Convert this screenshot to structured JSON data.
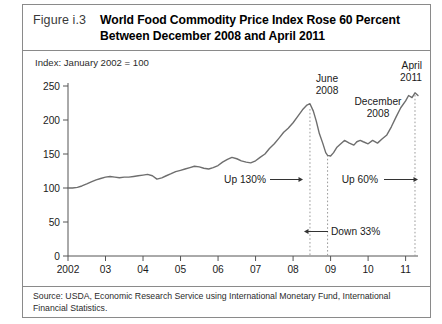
{
  "figure": {
    "label": "Figure i.3",
    "title_line1": "World Food Commodity Price Index Rose 60 Percent",
    "title_line2": "Between December 2008 and April 2011",
    "index_note": "Index: January 2002 = 100",
    "source": "Source: USDA, Economic Research Service using International Monetary Fund, International Financial Statistics."
  },
  "chart_data": {
    "type": "line",
    "title": "World Food Commodity Price Index Rose 60 Percent Between December 2008 and April 2011",
    "subtitle": "Index: January 2002 = 100",
    "xlabel": "",
    "ylabel": "Index: January 2002 = 100",
    "ylim": [
      0,
      250
    ],
    "yticks": [
      0,
      50,
      100,
      150,
      200,
      250
    ],
    "ytick_labels": [
      "0",
      "50",
      "100",
      "150",
      "200",
      "250"
    ],
    "xlim": [
      2002.0,
      2011.33
    ],
    "xticks": [
      2002,
      2003,
      2004,
      2005,
      2006,
      2007,
      2008,
      2009,
      2010,
      2011
    ],
    "xtick_labels": [
      "2002",
      "03",
      "04",
      "05",
      "06",
      "07",
      "08",
      "09",
      "10",
      "11"
    ],
    "grid": false,
    "legend": null,
    "line_color": "#6e6e6e",
    "series": [
      {
        "name": "World Food Commodity Price Index",
        "x": [
          2002.0,
          2002.12,
          2002.25,
          2002.37,
          2002.5,
          2002.62,
          2002.75,
          2002.87,
          2003.0,
          2003.12,
          2003.25,
          2003.37,
          2003.5,
          2003.62,
          2003.75,
          2003.87,
          2004.0,
          2004.12,
          2004.25,
          2004.37,
          2004.5,
          2004.62,
          2004.75,
          2004.87,
          2005.0,
          2005.12,
          2005.25,
          2005.37,
          2005.5,
          2005.62,
          2005.75,
          2005.87,
          2006.0,
          2006.12,
          2006.25,
          2006.37,
          2006.5,
          2006.62,
          2006.75,
          2006.87,
          2007.0,
          2007.12,
          2007.25,
          2007.37,
          2007.5,
          2007.62,
          2007.75,
          2007.87,
          2008.0,
          2008.12,
          2008.25,
          2008.37,
          2008.45,
          2008.54,
          2008.62,
          2008.7,
          2008.79,
          2008.87,
          2008.92,
          2009.0,
          2009.08,
          2009.17,
          2009.25,
          2009.37,
          2009.5,
          2009.62,
          2009.7,
          2009.79,
          2009.87,
          2010.0,
          2010.12,
          2010.25,
          2010.37,
          2010.5,
          2010.62,
          2010.75,
          2010.87,
          2011.0,
          2011.08,
          2011.17,
          2011.25,
          2011.33
        ],
        "values": [
          100,
          100,
          101,
          103,
          106,
          109,
          112,
          114,
          116,
          117,
          116,
          115,
          116,
          116,
          117,
          118,
          119,
          120,
          118,
          113,
          115,
          118,
          121,
          124,
          126,
          128,
          130,
          132,
          131,
          129,
          128,
          130,
          133,
          138,
          142,
          145,
          143,
          140,
          138,
          137,
          140,
          145,
          150,
          158,
          165,
          173,
          182,
          188,
          196,
          205,
          215,
          222,
          224,
          213,
          198,
          180,
          166,
          152,
          148,
          147,
          152,
          160,
          164,
          170,
          166,
          163,
          168,
          170,
          168,
          165,
          170,
          166,
          172,
          178,
          190,
          205,
          218,
          228,
          236,
          233,
          240,
          236
        ]
      }
    ],
    "annotations": [
      {
        "name": "june-2008",
        "text_line1": "June",
        "text_line2": "2008",
        "x": 2008.45,
        "type": "vline-label"
      },
      {
        "name": "december-2008",
        "text_line1": "December",
        "text_line2": "2008",
        "x": 2008.92,
        "type": "vline-label"
      },
      {
        "name": "april-2011",
        "text_line1": "April",
        "text_line2": "2011",
        "x": 2011.25,
        "type": "vline-label"
      },
      {
        "name": "up-130",
        "text": "Up 130%",
        "direction": "right",
        "value": 130
      },
      {
        "name": "up-60",
        "text": "Up 60%",
        "direction": "right",
        "value": 60
      },
      {
        "name": "down-33",
        "text": "Down 33%",
        "direction": "left",
        "value": -33
      }
    ]
  }
}
